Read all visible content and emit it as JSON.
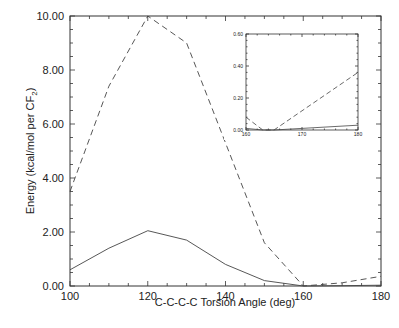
{
  "chart_data": [
    {
      "type": "line",
      "title": "",
      "xlabel": "C-C-C-C Torsion Angle (deg)",
      "ylabel": "Energy (kcal/mol per CF2)",
      "xlim": [
        100,
        180
      ],
      "ylim": [
        0,
        10
      ],
      "x_ticks": [
        "100",
        "120",
        "140",
        "160",
        "180"
      ],
      "y_ticks": [
        "0.00",
        "2.00",
        "4.00",
        "6.00",
        "8.00",
        "10.00"
      ],
      "grid": false,
      "legend": null,
      "x": [
        100,
        110,
        120,
        130,
        140,
        150,
        160,
        170,
        180
      ],
      "series": [
        {
          "name": "dashed",
          "style": "dashed",
          "values": [
            3.5,
            7.4,
            10.0,
            9.0,
            5.3,
            1.6,
            0.0,
            0.12,
            0.36
          ]
        },
        {
          "name": "solid",
          "style": "solid",
          "values": [
            0.6,
            1.4,
            2.05,
            1.7,
            0.8,
            0.2,
            0.0,
            0.01,
            0.03
          ]
        }
      ]
    },
    {
      "type": "line",
      "title": "inset",
      "xlim": [
        160,
        180
      ],
      "ylim": [
        0,
        0.6
      ],
      "x_ticks": [
        "160",
        "170",
        "180"
      ],
      "y_ticks": [
        "0.00",
        "0.20",
        "0.40",
        "0.60"
      ],
      "x": [
        160,
        163,
        165,
        170,
        180
      ],
      "series": [
        {
          "name": "dashed",
          "style": "dashed",
          "values": [
            0.08,
            0.0,
            0.0,
            0.12,
            0.36
          ]
        },
        {
          "name": "solid",
          "style": "solid",
          "values": [
            0.01,
            0.0,
            0.0,
            0.01,
            0.03
          ]
        }
      ]
    }
  ],
  "labels": {
    "xlabel": "C-C-C-C Torsion Angle (deg)",
    "ylabel_main": "Energy (kcal/mol per CF",
    "ylabel_sub": "2",
    "ylabel_close": ")"
  }
}
